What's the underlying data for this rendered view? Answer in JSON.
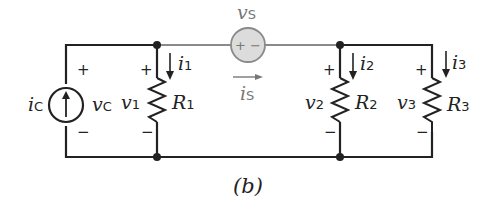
{
  "figure": {
    "caption": "(b)",
    "colors": {
      "wire": "#222222",
      "series_wire": "#8a8a8a",
      "source_fill": "#dcdcdc",
      "label_gray": "#777777"
    },
    "components": [
      {
        "id": "current-source",
        "type": "current_source",
        "current": "i",
        "current_sub": "C",
        "voltage": "v",
        "voltage_sub": "C",
        "plus": "+",
        "minus": "−",
        "arrow": "up"
      },
      {
        "id": "R1",
        "type": "resistor",
        "name": "R",
        "name_sub": "1",
        "voltage": "v",
        "voltage_sub": "1",
        "current": "i",
        "current_sub": "1",
        "plus": "+",
        "minus": "−"
      },
      {
        "id": "voltage-source",
        "type": "voltage_source",
        "voltage": "v",
        "voltage_sub": "S",
        "current": "i",
        "current_sub": "S",
        "polarity": "+ −"
      },
      {
        "id": "R2",
        "type": "resistor",
        "name": "R",
        "name_sub": "2",
        "voltage": "v",
        "voltage_sub": "2",
        "current": "i",
        "current_sub": "2",
        "plus": "+",
        "minus": "−"
      },
      {
        "id": "R3",
        "type": "resistor",
        "name": "R",
        "name_sub": "3",
        "voltage": "v",
        "voltage_sub": "3",
        "current": "i",
        "current_sub": "3",
        "plus": "+",
        "minus": "−"
      }
    ]
  }
}
